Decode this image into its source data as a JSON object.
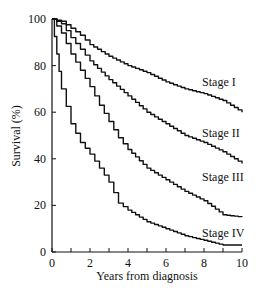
{
  "chart_data": {
    "type": "line",
    "title": "",
    "xlabel": "Years from diagnosis",
    "ylabel": "Survival (%)",
    "xlim": [
      0,
      10
    ],
    "ylim": [
      0,
      100
    ],
    "x_ticks": [
      0,
      2,
      4,
      6,
      8,
      10
    ],
    "x_minor_ticks": [
      1,
      3,
      5,
      7,
      9
    ],
    "y_ticks": [
      0,
      20,
      40,
      60,
      80,
      100
    ],
    "grid": false,
    "legend": "inline labels at right of each curve",
    "series": [
      {
        "name": "Stage I",
        "x": [
          0,
          0.5,
          1,
          1.5,
          2,
          3,
          4,
          5,
          6,
          7,
          8,
          9,
          10
        ],
        "values": [
          100,
          99,
          96,
          93,
          89,
          84,
          80,
          77,
          73,
          70,
          68,
          65,
          60
        ],
        "label_pos": [
          7.9,
          73
        ]
      },
      {
        "name": "Stage II",
        "x": [
          0,
          0.5,
          1,
          1.5,
          2,
          3,
          4,
          5,
          6,
          7,
          8,
          9,
          10
        ],
        "values": [
          100,
          98,
          92,
          87,
          82,
          74,
          67,
          60,
          55,
          50,
          47,
          43,
          38
        ],
        "label_pos": [
          7.9,
          51
        ]
      },
      {
        "name": "Stage III",
        "x": [
          0,
          0.5,
          1,
          1.5,
          2,
          2.5,
          3,
          3.5,
          4,
          5,
          6,
          7,
          8,
          9,
          10
        ],
        "values": [
          100,
          94,
          85,
          78,
          71,
          63,
          56,
          49,
          44,
          36,
          31,
          26,
          22,
          16,
          15
        ],
        "label_pos": [
          7.9,
          32
        ]
      },
      {
        "name": "Stage IV",
        "x": [
          0,
          0.25,
          0.5,
          1,
          1.5,
          2,
          2.5,
          3,
          3.5,
          4,
          5,
          6,
          7,
          8,
          9,
          10
        ],
        "values": [
          100,
          85,
          70,
          55,
          47,
          42,
          36,
          30,
          21,
          18,
          13,
          10,
          7,
          5,
          3,
          3
        ],
        "label_pos": [
          7.9,
          8
        ]
      }
    ]
  }
}
